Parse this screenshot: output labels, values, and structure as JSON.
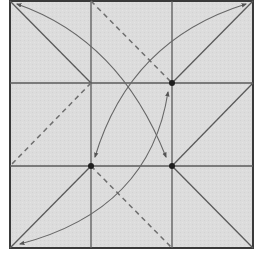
{
  "diagram": {
    "colors": {
      "paper": "#dcdcdc",
      "border": "#3a3a3a",
      "crease": "#5a5a5a",
      "valley": "#6e6e6e",
      "arrow": "#666666",
      "dot": "#1e1e1e",
      "background": "#ffffff"
    },
    "square": {
      "x": 10,
      "y": 1,
      "size": 243
    },
    "grid": {
      "verticals": [
        91,
        172
      ],
      "horizontals": [
        83,
        166
      ]
    },
    "solid_lines": [
      {
        "x1": 10,
        "y1": 1,
        "x2": 91,
        "y2": 83
      },
      {
        "x1": 172,
        "y1": 83,
        "x2": 253,
        "y2": 1
      },
      {
        "x1": 172,
        "y1": 166,
        "x2": 253,
        "y2": 83
      },
      {
        "x1": 172,
        "y1": 166,
        "x2": 253,
        "y2": 248
      },
      {
        "x1": 91,
        "y1": 166,
        "x2": 10,
        "y2": 248
      }
    ],
    "dashed_lines": [
      {
        "x1": 91,
        "y1": 1,
        "x2": 172,
        "y2": 83
      },
      {
        "x1": 91,
        "y1": 83,
        "x2": 10,
        "y2": 166
      },
      {
        "x1": 91,
        "y1": 166,
        "x2": 172,
        "y2": 248
      }
    ],
    "dots": [
      {
        "cx": 172,
        "cy": 83
      },
      {
        "cx": 91,
        "cy": 166
      },
      {
        "cx": 172,
        "cy": 166
      }
    ],
    "arrows": [
      {
        "name": "arc-top-left-to-center-bottom-right",
        "d": "M 17 4 Q 120 40 166 157",
        "start_head": true,
        "end_head": true
      },
      {
        "name": "arc-top-right-to-center-bottom-left",
        "d": "M 246 4 Q 130 40 95 157",
        "start_head": true,
        "end_head": true
      },
      {
        "name": "arc-bottom-left-to-center-top-right",
        "d": "M 20 244 Q 150 210 168 92",
        "start_head": true,
        "end_head": true
      }
    ]
  }
}
